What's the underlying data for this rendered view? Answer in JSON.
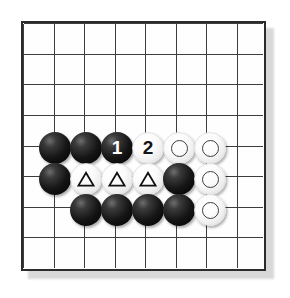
{
  "diagram": {
    "kind": "go-board-diagram",
    "board": {
      "columns": 8,
      "rows": 8,
      "line_color": "#3a3a3a",
      "border_color": "#2b2b2b",
      "background_color": "#fefefe",
      "shadow_color": "#d8d8d8"
    },
    "colors": {
      "black_stone": "#111111",
      "white_stone": "#f7f7f7",
      "black_label_text": "#ffffff",
      "white_label_text": "#141414",
      "marker_stroke": "#111111"
    },
    "stones": [
      {
        "id": "s1",
        "col": 2,
        "row": 5,
        "color": "black",
        "marker": "none",
        "label": ""
      },
      {
        "id": "s2",
        "col": 3,
        "row": 5,
        "color": "black",
        "marker": "none",
        "label": ""
      },
      {
        "id": "s3",
        "col": 4,
        "row": 5,
        "color": "black",
        "marker": "number",
        "label": "1"
      },
      {
        "id": "s4",
        "col": 5,
        "row": 5,
        "color": "white",
        "marker": "number",
        "label": "2"
      },
      {
        "id": "s5",
        "col": 6,
        "row": 5,
        "color": "white",
        "marker": "circle",
        "label": ""
      },
      {
        "id": "s6",
        "col": 7,
        "row": 5,
        "color": "white",
        "marker": "circle",
        "label": ""
      },
      {
        "id": "s7",
        "col": 2,
        "row": 6,
        "color": "black",
        "marker": "none",
        "label": ""
      },
      {
        "id": "s8",
        "col": 3,
        "row": 6,
        "color": "white",
        "marker": "triangle",
        "label": ""
      },
      {
        "id": "s9",
        "col": 4,
        "row": 6,
        "color": "white",
        "marker": "triangle",
        "label": ""
      },
      {
        "id": "s10",
        "col": 5,
        "row": 6,
        "color": "white",
        "marker": "triangle",
        "label": ""
      },
      {
        "id": "s11",
        "col": 6,
        "row": 6,
        "color": "black",
        "marker": "none",
        "label": ""
      },
      {
        "id": "s12",
        "col": 7,
        "row": 6,
        "color": "white",
        "marker": "circle",
        "label": ""
      },
      {
        "id": "s13",
        "col": 3,
        "row": 7,
        "color": "black",
        "marker": "none",
        "label": ""
      },
      {
        "id": "s14",
        "col": 4,
        "row": 7,
        "color": "black",
        "marker": "none",
        "label": ""
      },
      {
        "id": "s15",
        "col": 5,
        "row": 7,
        "color": "black",
        "marker": "none",
        "label": ""
      },
      {
        "id": "s16",
        "col": 6,
        "row": 7,
        "color": "black",
        "marker": "none",
        "label": ""
      },
      {
        "id": "s17",
        "col": 7,
        "row": 7,
        "color": "white",
        "marker": "circle",
        "label": ""
      }
    ]
  }
}
